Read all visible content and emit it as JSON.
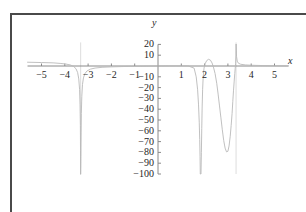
{
  "figure": {
    "frame_color": "#4a4a4a",
    "background": "#ffffff"
  },
  "chart_data": {
    "type": "line",
    "title": "",
    "subtitle": "",
    "xlabel": "x",
    "ylabel": "y",
    "xlim": [
      -5.6,
      5.6
    ],
    "ylim": [
      -100,
      20
    ],
    "xticks": [
      -5,
      -4,
      -3,
      -2,
      -1,
      1,
      2,
      3,
      4,
      5
    ],
    "xtick_labels": [
      "−5",
      "−4",
      "−3",
      "−2",
      "−1",
      "1",
      "2",
      "3",
      "4",
      "5"
    ],
    "yticks": [
      20,
      10,
      -10,
      -20,
      -30,
      -40,
      -50,
      -60,
      -70,
      -80,
      -90,
      -100
    ],
    "ytick_labels": [
      "20",
      "10",
      "−10",
      "−20",
      "−30",
      "−40",
      "−50",
      "−60",
      "−70",
      "−80",
      "−90",
      "−100"
    ],
    "grid": false,
    "legend": null,
    "curve_color": "#b9b9b9",
    "axis_color": "#8a8a8a",
    "asymptotes": [
      -3.32,
      3.35
    ],
    "local_max": {
      "x": 2.2,
      "y": 6
    },
    "local_min": {
      "x": 2.9,
      "y": -80
    },
    "x_intercepts": [
      1.85,
      2.05,
      2.38
    ],
    "series": [
      {
        "name": "f(x)",
        "points": [
          [
            -3.32,
            -100
          ],
          [
            -3.31,
            -84
          ],
          [
            -3.3,
            -62
          ],
          [
            -3.29,
            -44
          ],
          [
            -3.27,
            -28
          ],
          [
            -3.24,
            -17
          ],
          [
            -3.2,
            -11
          ],
          [
            -3.14,
            -7.2
          ],
          [
            -3.05,
            -4.6
          ],
          [
            -2.9,
            -2.9
          ],
          [
            -2.7,
            -1.9
          ],
          [
            -2.4,
            -1.2
          ],
          [
            -2.0,
            -0.8
          ],
          [
            -1.5,
            -0.5
          ],
          [
            -1.0,
            -0.3
          ],
          [
            -0.5,
            -0.15
          ],
          [
            0.0,
            0.0
          ],
          [
            0.5,
            0.1
          ],
          [
            1.0,
            0.15
          ],
          [
            1.3,
            0.05
          ],
          [
            1.55,
            -2.0
          ],
          [
            1.64,
            -10
          ],
          [
            1.7,
            -22
          ],
          [
            1.74,
            -36
          ],
          [
            1.77,
            -52
          ],
          [
            1.79,
            -68
          ],
          [
            1.805,
            -84
          ],
          [
            1.815,
            -100
          ],
          [
            1.845,
            -100
          ],
          [
            1.862,
            -80
          ],
          [
            1.878,
            -58
          ],
          [
            1.895,
            -38
          ],
          [
            1.915,
            -22
          ],
          [
            1.94,
            -10
          ],
          [
            1.975,
            -2.0
          ],
          [
            2.02,
            2.0
          ],
          [
            2.09,
            5.0
          ],
          [
            2.17,
            6.2
          ],
          [
            2.25,
            5.4
          ],
          [
            2.32,
            2.8
          ],
          [
            2.38,
            -1.0
          ],
          [
            2.45,
            -7.0
          ],
          [
            2.52,
            -16
          ],
          [
            2.58,
            -26
          ],
          [
            2.64,
            -37
          ],
          [
            2.7,
            -48
          ],
          [
            2.76,
            -59
          ],
          [
            2.82,
            -69
          ],
          [
            2.88,
            -76
          ],
          [
            2.94,
            -79.5
          ],
          [
            3.0,
            -79
          ],
          [
            3.05,
            -74
          ],
          [
            3.1,
            -65
          ],
          [
            3.14,
            -55
          ],
          [
            3.18,
            -44
          ],
          [
            3.21,
            -33
          ],
          [
            3.24,
            -23
          ],
          [
            3.27,
            -14
          ],
          [
            3.295,
            -7.0
          ],
          [
            3.315,
            -2.0
          ],
          [
            3.33,
            2.0
          ],
          [
            3.345,
            10
          ],
          [
            3.352,
            20
          ]
        ]
      },
      {
        "name": "left-branch-upper",
        "points": [
          [
            -5.6,
            3.5
          ],
          [
            -5.0,
            3.2
          ],
          [
            -4.5,
            2.9
          ],
          [
            -4.2,
            2.4
          ],
          [
            -3.95,
            1.8
          ],
          [
            -3.75,
            0.9
          ],
          [
            -3.62,
            -0.4
          ],
          [
            -3.52,
            -2.5
          ],
          [
            -3.45,
            -6.0
          ],
          [
            -3.4,
            -12
          ],
          [
            -3.365,
            -22
          ],
          [
            -3.345,
            -36
          ],
          [
            -3.332,
            -55
          ],
          [
            -3.325,
            -78
          ],
          [
            -3.322,
            -100
          ]
        ]
      },
      {
        "name": "right-branch-upper",
        "points": [
          [
            3.355,
            20
          ],
          [
            3.37,
            9.0
          ],
          [
            3.4,
            4.5
          ],
          [
            3.45,
            2.6
          ],
          [
            3.55,
            1.6
          ],
          [
            3.75,
            1.0
          ],
          [
            4.0,
            0.7
          ],
          [
            4.5,
            0.4
          ],
          [
            5.0,
            0.25
          ],
          [
            5.6,
            0.15
          ]
        ]
      }
    ]
  }
}
